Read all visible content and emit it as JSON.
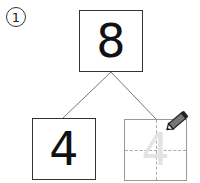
{
  "problem": {
    "number_label": "1",
    "whole": "8",
    "part_known": "4",
    "part_answer_trace": "4"
  },
  "icons": {
    "pencil": "pencil-icon"
  },
  "colors": {
    "box_border": "#333333",
    "answer_box_border": "#999999",
    "trace_digit": "#e3e3e3",
    "guide_lines": "#aaaaaa"
  }
}
